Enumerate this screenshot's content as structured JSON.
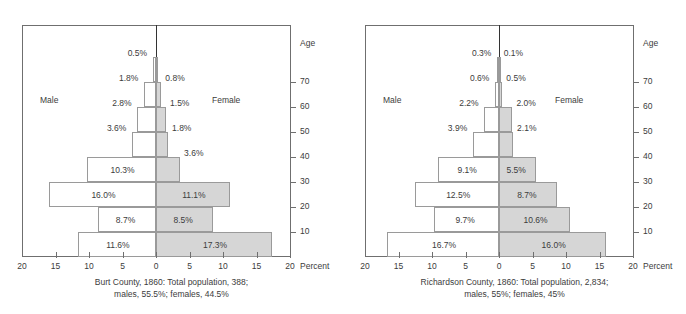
{
  "chart_data": [
    {
      "type": "bar",
      "subtype": "population-pyramid",
      "title": "Burt County, 1860: Total population, 388; males, 55.5%; females, 44.5%",
      "caption_lines": [
        "Burt County, 1860: Total population, 388;",
        "males, 55.5%; females, 44.5%"
      ],
      "xlabel": "Percent",
      "ylabel": "Age",
      "xlim": [
        -20,
        20
      ],
      "xticks": [
        20,
        15,
        10,
        5,
        0,
        5,
        10,
        15,
        20
      ],
      "yticks": [
        70,
        60,
        50,
        40,
        30,
        20,
        10
      ],
      "grid": false,
      "legend": [
        "Male",
        "Female"
      ],
      "side_labels": {
        "left": "Male",
        "right": "Female"
      },
      "categories": [
        "0-10",
        "10-20",
        "20-30",
        "30-40",
        "40-50",
        "50-60",
        "60-70",
        "70+"
      ],
      "series": [
        {
          "name": "Male",
          "values": [
            11.6,
            8.7,
            16.0,
            10.3,
            3.6,
            2.8,
            1.8,
            0.5
          ],
          "labels": [
            "11.6%",
            "8.7%",
            "16.0%",
            "10.3%",
            "3.6%",
            "2.8%",
            "1.8%",
            "0.5%"
          ]
        },
        {
          "name": "Female",
          "values": [
            17.3,
            8.5,
            11.1,
            3.6,
            1.8,
            1.5,
            0.8,
            0.2
          ],
          "labels": [
            "17.3%",
            "8.5%",
            "11.1%",
            "3.6%",
            "1.8%",
            "1.5%",
            "0.8%",
            ""
          ]
        }
      ]
    },
    {
      "type": "bar",
      "subtype": "population-pyramid",
      "title": "Richardson County, 1860: Total population, 2,834; males, 55%; females, 45%",
      "caption_lines": [
        "Richardson County, 1860: Total population, 2,834;",
        "males, 55%; females, 45%"
      ],
      "xlabel": "Percent",
      "ylabel": "Age",
      "xlim": [
        -20,
        20
      ],
      "xticks": [
        20,
        15,
        10,
        5,
        0,
        5,
        10,
        15,
        20
      ],
      "yticks": [
        70,
        60,
        50,
        40,
        30,
        20,
        10
      ],
      "grid": false,
      "legend": [
        "Male",
        "Female"
      ],
      "side_labels": {
        "left": "Male",
        "right": "Female"
      },
      "categories": [
        "0-10",
        "10-20",
        "20-30",
        "30-40",
        "40-50",
        "50-60",
        "60-70",
        "70+"
      ],
      "series": [
        {
          "name": "Male",
          "values": [
            16.7,
            9.7,
            12.5,
            9.1,
            3.9,
            2.2,
            0.6,
            0.3
          ],
          "labels": [
            "16.7%",
            "9.7%",
            "12.5%",
            "9.1%",
            "3.9%",
            "2.2%",
            "0.6%",
            "0.3%"
          ]
        },
        {
          "name": "Female",
          "values": [
            16.0,
            10.6,
            8.7,
            5.5,
            2.1,
            2.0,
            0.5,
            0.1
          ],
          "labels": [
            "16.0%",
            "10.6%",
            "8.7%",
            "5.5%",
            "2.1%",
            "2.0%",
            "0.5%",
            "0.1%"
          ]
        }
      ]
    }
  ],
  "style": {
    "male_fill": "#ffffff",
    "female_fill": "#d6d6d6",
    "bar_stroke": "#9a9a9a",
    "axis_color": "#6f6f6f",
    "text_color": "#3c3c3c"
  }
}
